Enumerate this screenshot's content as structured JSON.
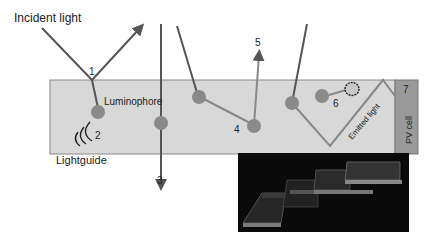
{
  "diagram": {
    "labels": {
      "incident_light": "Incident light",
      "luminophore": "Luminophore",
      "lightguide": "Lightguide",
      "emitted_light": "Emitted light",
      "pv_cell": "PV cell"
    },
    "numbers": {
      "n1": "1",
      "n2": "2",
      "n3": "3",
      "n4": "4",
      "n5": "5",
      "n6": "6",
      "n7": "7"
    },
    "colors": {
      "lightguide_fill": "#d8d8d8",
      "luminophore": "#8a8a8a",
      "pv_cell": "#9a9a9a",
      "ray": "#555555",
      "photo_bg": "#0a0a0a"
    }
  }
}
